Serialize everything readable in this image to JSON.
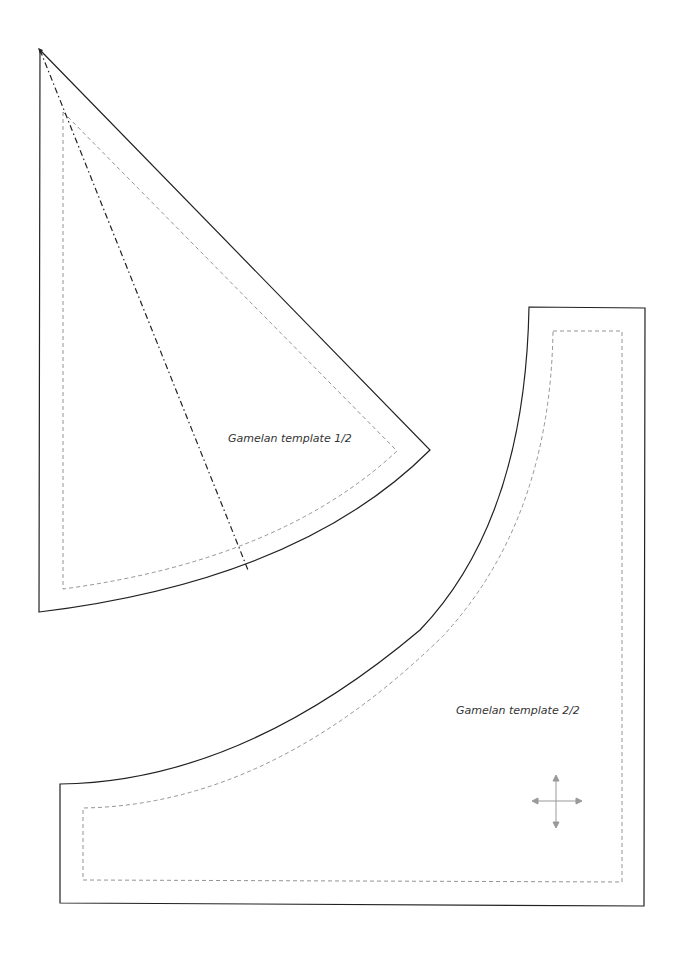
{
  "page": {
    "background": "#ffffff",
    "line_color": "#222222",
    "seam_color": "#888888"
  },
  "pieces": [
    {
      "name": "piece-1",
      "label": "Gamelan template 1/2",
      "has_fold_line": true
    },
    {
      "name": "piece-2",
      "label": "Gamelan template 2/2",
      "has_grainline_cross": true
    }
  ],
  "icons": {
    "grainline": "four-way-arrow-icon"
  }
}
